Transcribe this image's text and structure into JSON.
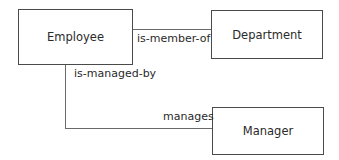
{
  "diagram": {
    "entities": [
      {
        "id": "employee",
        "label": "Employee"
      },
      {
        "id": "department",
        "label": "Department"
      },
      {
        "id": "manager",
        "label": "Manager"
      }
    ],
    "relationships": [
      {
        "from": "employee",
        "to": "department",
        "label": "is-member-of"
      },
      {
        "from": "employee",
        "to": "manager",
        "label_from_side": "is-managed-by",
        "label_to_side": "manages"
      }
    ],
    "colors": {
      "stroke": "#4a4a4a",
      "text": "#2a2a2a",
      "background": "#ffffff"
    }
  }
}
